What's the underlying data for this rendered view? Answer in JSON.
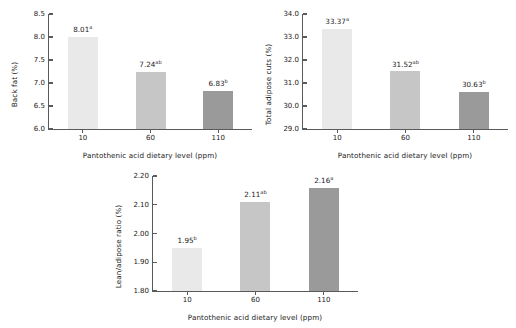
{
  "figure": {
    "background": "#ffffff",
    "axis_color": "#5a5a5a",
    "text_color": "#1a1a1a"
  },
  "bar_colors": [
    "#e9e9e9",
    "#c6c6c6",
    "#9a9a9a"
  ],
  "chart_data": [
    {
      "type": "bar",
      "name": "back-fat",
      "title": "",
      "xlabel": "Pantothenic acid dietary level (ppm)",
      "ylabel": "Back fat (%)",
      "categories": [
        "10",
        "60",
        "110"
      ],
      "values": [
        8.01,
        7.24,
        6.83
      ],
      "value_labels": [
        "8.01",
        "7.24",
        "6.83"
      ],
      "superscripts": [
        "a",
        "ab",
        "b"
      ],
      "ylim": [
        6.0,
        8.5
      ],
      "ytick_step": 0.5,
      "ytick_labels": [
        "8.5",
        "8.0",
        "7.5",
        "7.0",
        "6.5",
        "6.0"
      ],
      "ytick_values": [
        8.5,
        8.0,
        7.5,
        7.0,
        6.5,
        6.0
      ],
      "grid": false,
      "legend": "none"
    },
    {
      "type": "bar",
      "name": "total-adipose-cuts",
      "title": "",
      "xlabel": "Pantothenic acid dietary level (ppm)",
      "ylabel": "Total adipose cuts (%)",
      "categories": [
        "10",
        "60",
        "110"
      ],
      "values": [
        33.37,
        31.52,
        30.63
      ],
      "value_labels": [
        "33.37",
        "31.52",
        "30.63"
      ],
      "superscripts": [
        "a",
        "ab",
        "b"
      ],
      "ylim": [
        29.0,
        34.0
      ],
      "ytick_step": 1.0,
      "ytick_labels": [
        "34.0",
        "33.0",
        "32.0",
        "31.0",
        "30.0",
        "29.0"
      ],
      "ytick_values": [
        34.0,
        33.0,
        32.0,
        31.0,
        30.0,
        29.0
      ],
      "grid": false,
      "legend": "none"
    },
    {
      "type": "bar",
      "name": "lean-adipose-ratio",
      "title": "",
      "xlabel": "Pantothenic acid dietary level (ppm)",
      "ylabel": "Lean/adipose ratio (%)",
      "categories": [
        "10",
        "60",
        "110"
      ],
      "values": [
        1.95,
        2.11,
        2.16
      ],
      "value_labels": [
        "1.95",
        "2.11",
        "2.16"
      ],
      "superscripts": [
        "b",
        "ab",
        "a"
      ],
      "ylim": [
        1.8,
        2.2
      ],
      "ytick_step": 0.1,
      "ytick_labels": [
        "2.20",
        "2.10",
        "2.00",
        "1.90",
        "1.80"
      ],
      "ytick_values": [
        2.2,
        2.1,
        2.0,
        1.9,
        1.8
      ],
      "grid": false,
      "legend": "none"
    }
  ]
}
